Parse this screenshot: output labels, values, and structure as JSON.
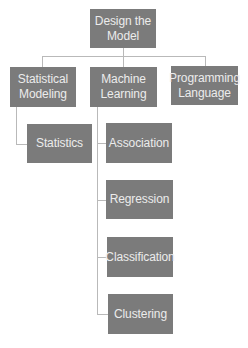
{
  "diagram": {
    "type": "hierarchy",
    "colors": {
      "node_fill": "#7b7b7b",
      "node_text": "#ececec",
      "connector": "#b9b9b9",
      "background": "#ffffff"
    },
    "root": {
      "label": "Design the\nModel"
    },
    "level1": [
      {
        "label": "Statistical\nModeling"
      },
      {
        "label": "Machine\nLearning"
      },
      {
        "label": "Programming\nLanguage"
      }
    ],
    "statistical_children": [
      {
        "label": "Statistics"
      }
    ],
    "machine_learning_children": [
      {
        "label": "Association"
      },
      {
        "label": "Regression"
      },
      {
        "label": "Classification"
      },
      {
        "label": "Clustering"
      }
    ]
  }
}
